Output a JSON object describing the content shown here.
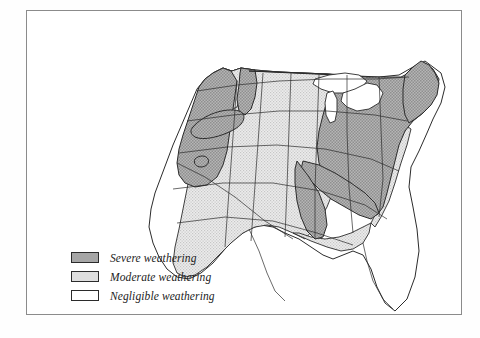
{
  "figure": {
    "frame": {
      "visible": true,
      "border_color": "#8b8b8b"
    },
    "background_color": "#ffffff"
  },
  "legend": {
    "items": [
      {
        "key": "severe",
        "label": "Severe weathering",
        "swatch_color": "#a6a6a6",
        "swatch_name": "severe-swatch"
      },
      {
        "key": "moderate",
        "label": "Moderate weathering",
        "swatch_color": "#dedede",
        "swatch_name": "moderate-swatch"
      },
      {
        "key": "negligible",
        "label": "Negligible weathering",
        "swatch_color": "#ffffff",
        "swatch_name": "negligible-swatch"
      }
    ]
  },
  "map": {
    "region": "Contiguous United States",
    "categories": [
      {
        "key": "severe",
        "fill": "#a6a6a6"
      },
      {
        "key": "moderate",
        "fill": "#dedede"
      },
      {
        "key": "negligible",
        "fill": "#ffffff"
      }
    ],
    "outline_color": "#2b2b2b",
    "water_color": "#ffffff",
    "classification": {
      "severe": [
        "Washington (west)",
        "Oregon",
        "Northern California",
        "Idaho (west)",
        "Idaho (north)",
        "Colorado (mountain patch)",
        "Minnesota",
        "Iowa",
        "Missouri",
        "Arkansas",
        "Wisconsin",
        "Illinois",
        "Michigan",
        "Indiana",
        "Ohio",
        "Kentucky",
        "Tennessee",
        "Pennsylvania",
        "New York",
        "West Virginia",
        "Virginia",
        "North Carolina",
        "South Carolina",
        "Georgia (north)",
        "Alabama (north)",
        "Mississippi (north)",
        "Maryland",
        "New Jersey",
        "Connecticut",
        "Rhode Island",
        "Massachusetts",
        "Vermont",
        "New Hampshire",
        "Maine",
        "Louisiana (north)"
      ],
      "moderate": [
        "Washington (east)",
        "Montana",
        "Wyoming",
        "North Dakota",
        "South Dakota",
        "Nebraska",
        "Kansas",
        "Oklahoma",
        "Utah (north)",
        "Colorado",
        "Texas (north)",
        "Nevada (north)",
        "Florida (panhandle)",
        "Gulf Coast strip",
        "Atlantic coastal strip"
      ],
      "negligible": [
        "Southern California",
        "Nevada (south)",
        "Arizona",
        "New Mexico",
        "Utah (south)",
        "Texas (south)",
        "Florida (peninsula)"
      ]
    }
  }
}
